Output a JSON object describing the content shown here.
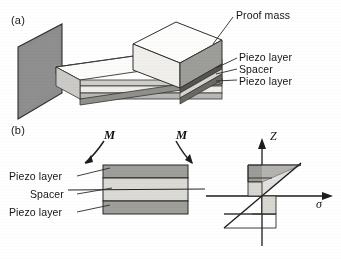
{
  "figure": {
    "panels": [
      {
        "key": "a",
        "label": "(a)"
      },
      {
        "key": "b",
        "label": "(b)"
      }
    ]
  },
  "panel_a": {
    "label": "(a)",
    "callouts": [
      {
        "name": "proof-mass",
        "text": "Proof mass"
      },
      {
        "name": "piezo-layer-top",
        "text": "Piezo layer"
      },
      {
        "name": "spacer",
        "text": "Spacer"
      },
      {
        "name": "piezo-layer-bottom",
        "text": "Piezo layer"
      }
    ],
    "parts": {
      "wall_anchor": "wall-anchor",
      "beam": "cantilever-beam",
      "proof_mass": "proof-mass-block"
    }
  },
  "panel_b": {
    "label": "(b)",
    "callouts": [
      {
        "name": "piezo-layer-top",
        "text": "Piezo layer"
      },
      {
        "name": "spacer",
        "text": "Spacer"
      },
      {
        "name": "piezo-layer-bottom",
        "text": "Piezo layer"
      }
    ],
    "moments": [
      {
        "name": "moment-left",
        "text": "M"
      },
      {
        "name": "moment-right",
        "text": "M"
      }
    ]
  },
  "stress_plot": {
    "vertical_axis_label": "Z",
    "horizontal_axis_label": "σ",
    "description": "Linear bending stress distribution through the beam thickness",
    "origin_at_neutral_axis": true
  },
  "colors": {
    "ink": "#141414",
    "wall_fill": "#8d8d8d",
    "wall_edge": "#3a3a3a",
    "piezo_fill": "#9a9a9a",
    "spacer_fill": "#d4d2cd",
    "beam_top_fill": "#f2f1ee",
    "proof_mass_top": "#fbfbfa",
    "proof_mass_front": "#ededea",
    "proof_mass_side": "#9b9b9b",
    "graph_piezo_fill": "#9d9d9d",
    "graph_spacer_fill": "#d6d4cf",
    "paper": "#ffffff"
  }
}
